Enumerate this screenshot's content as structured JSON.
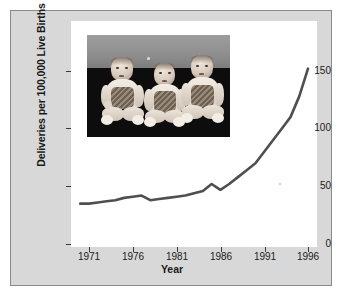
{
  "figure": {
    "background_color": "#ffffff",
    "panel_color": "#d8d8d8",
    "panel_border_color": "#8a8a8a",
    "plot_background_color": "#ffffff",
    "line_color": "#4f4f4f",
    "axis_color": "#3a3a3a",
    "text_color": "#1a1a1a"
  },
  "inset_photo": {
    "alt": "black and white photograph of three infant triplets seated side by side",
    "subject_count": 3,
    "upper_background_color": "#8e8e8e",
    "lower_background_color": "#0d0d0d"
  },
  "chart_data": {
    "type": "line",
    "title": "",
    "xlabel": "Year",
    "ylabel": "Deliveries per 100,000 Live Births",
    "xlim": [
      1969.5,
      1997.5
    ],
    "ylim": [
      0,
      165
    ],
    "grid": false,
    "legend": false,
    "xticks": [
      1971,
      1976,
      1981,
      1986,
      1991,
      1996
    ],
    "xtick_labels": [
      "1971",
      "1976",
      "1981",
      "1986",
      "1991",
      "1996"
    ],
    "yticks": [
      0,
      50,
      100,
      150
    ],
    "ytick_labels": [
      "0",
      "50",
      "100",
      "150"
    ],
    "series": [
      {
        "name": "Triplet and higher-order multiple deliveries",
        "x": [
          1970,
          1971,
          1972,
          1973,
          1974,
          1975,
          1976,
          1977,
          1978,
          1979,
          1980,
          1981,
          1982,
          1983,
          1984,
          1985,
          1986,
          1987,
          1988,
          1989,
          1990,
          1991,
          1992,
          1993,
          1994,
          1995,
          1996
        ],
        "values": [
          35,
          35,
          36,
          37,
          38,
          40,
          41,
          42,
          38,
          39,
          40,
          41,
          42,
          44,
          46,
          52,
          47,
          52,
          58,
          64,
          70,
          80,
          90,
          100,
          110,
          128,
          152
        ]
      }
    ]
  }
}
